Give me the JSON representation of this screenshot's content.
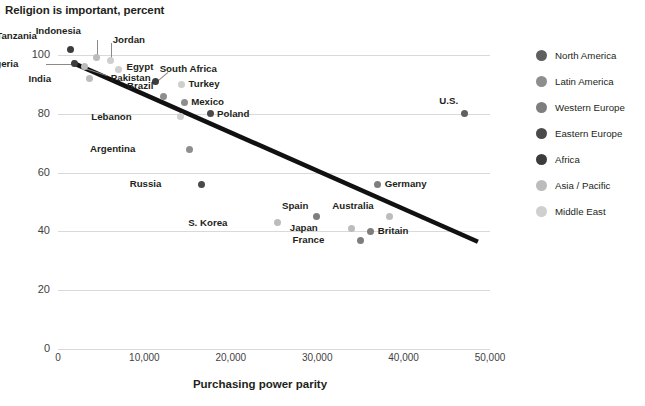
{
  "chart_data": {
    "type": "scatter",
    "title": "Religion is important, percent",
    "xlabel": "Purchasing power parity",
    "ylabel": "",
    "xlim": [
      0,
      50000
    ],
    "ylim": [
      0,
      105
    ],
    "xticks": [
      "0",
      "10,000",
      "20,000",
      "30,000",
      "40,000",
      "50,000"
    ],
    "xtick_values": [
      0,
      10000,
      20000,
      30000,
      40000,
      50000
    ],
    "yticks": [
      "0",
      "20",
      "40",
      "60",
      "80",
      "100"
    ],
    "ytick_values": [
      0,
      20,
      40,
      60,
      80,
      100
    ],
    "grid": true,
    "legend_position": "right",
    "trendline": {
      "x0": 1600,
      "y0": 97.5,
      "x1": 48600,
      "y1": 36.5,
      "color": "#111111"
    },
    "points": [
      {
        "label": "Tanzania",
        "x": 1500,
        "y": 102,
        "group": "Africa",
        "label_dx": -38,
        "label_dy": -14,
        "leader": null
      },
      {
        "label": "Nigeria",
        "x": 1900,
        "y": 97,
        "group": "Africa",
        "label_dx": -60,
        "label_dy": -1,
        "leader": "left"
      },
      {
        "label": "Indonesia",
        "x": 4500,
        "y": 99,
        "group": "Asia / Pacific",
        "label_dx": -20,
        "label_dy": -28,
        "leader": "up"
      },
      {
        "label": "Jordan",
        "x": 6100,
        "y": 98,
        "group": "Middle East",
        "label_dx": 2,
        "label_dy": -22,
        "leader": "up"
      },
      {
        "label": "Egypt",
        "x": 7000,
        "y": 95,
        "group": "Middle East",
        "label_dx": 8,
        "label_dy": -4,
        "leader": null
      },
      {
        "label": "Pakistan",
        "x": 3100,
        "y": 96,
        "group": "Asia / Pacific",
        "label_dx": 26,
        "label_dy": 10,
        "leader": "diag"
      },
      {
        "label": "India",
        "x": 3600,
        "y": 92,
        "group": "Asia / Pacific",
        "label_dx": -42,
        "label_dy": -1,
        "leader": null
      },
      {
        "label": "South Africa",
        "x": 11300,
        "y": 91,
        "group": "Africa",
        "label_dx": 4,
        "label_dy": -13,
        "leader": "diag2"
      },
      {
        "label": "Turkey",
        "x": 14300,
        "y": 90,
        "group": "Middle East",
        "label_dx": 7,
        "label_dy": -1,
        "leader": null
      },
      {
        "label": "Brazil",
        "x": 12200,
        "y": 86,
        "group": "Latin America",
        "label_dx": -14,
        "label_dy": -11,
        "leader": null
      },
      {
        "label": "Mexico",
        "x": 14600,
        "y": 84,
        "group": "Latin America",
        "label_dx": 7,
        "label_dy": -1,
        "leader": null
      },
      {
        "label": "Lebanon",
        "x": 14200,
        "y": 79,
        "group": "Middle East",
        "label_dx": -53,
        "label_dy": -1,
        "leader": null
      },
      {
        "label": "Poland",
        "x": 17600,
        "y": 80,
        "group": "Eastern Europe",
        "label_dx": 7,
        "label_dy": -1,
        "leader": null
      },
      {
        "label": "Argentina",
        "x": 15200,
        "y": 68,
        "group": "Latin America",
        "label_dx": -58,
        "label_dy": -1,
        "leader": null
      },
      {
        "label": "Russia",
        "x": 16600,
        "y": 56,
        "group": "Eastern Europe",
        "label_dx": -44,
        "label_dy": -1,
        "leader": null
      },
      {
        "label": "S. Korea",
        "x": 25400,
        "y": 43,
        "group": "Asia / Pacific",
        "label_dx": -54,
        "label_dy": -1,
        "leader": null
      },
      {
        "label": "Spain",
        "x": 29900,
        "y": 45,
        "group": "Western Europe",
        "label_dx": -12,
        "label_dy": -12,
        "leader": null
      },
      {
        "label": "Germany",
        "x": 37000,
        "y": 56,
        "group": "Western Europe",
        "label_dx": 7,
        "label_dy": -1,
        "leader": null
      },
      {
        "label": "Australia",
        "x": 38400,
        "y": 45,
        "group": "Asia / Pacific",
        "label_dx": -20,
        "label_dy": -12,
        "leader": null
      },
      {
        "label": "Japan",
        "x": 34000,
        "y": 41,
        "group": "Asia / Pacific",
        "label_dx": -38,
        "label_dy": -1,
        "leader": null
      },
      {
        "label": "Britain",
        "x": 36200,
        "y": 40,
        "group": "Western Europe",
        "label_dx": 7,
        "label_dy": -1,
        "leader": null
      },
      {
        "label": "France",
        "x": 35000,
        "y": 37,
        "group": "Western Europe",
        "label_dx": -40,
        "label_dy": -1,
        "leader": null
      },
      {
        "label": "U.S.",
        "x": 47000,
        "y": 80,
        "group": "North America",
        "label_dx": -10,
        "label_dy": -14,
        "leader": null
      }
    ]
  },
  "legend": {
    "items": [
      {
        "label": "North America",
        "color": "#5f5f5f"
      },
      {
        "label": "Latin America",
        "color": "#8e8e8e"
      },
      {
        "label": "Western Europe",
        "color": "#7e7e7e"
      },
      {
        "label": "Eastern Europe",
        "color": "#4a4a4a"
      },
      {
        "label": "Africa",
        "color": "#3c3c3c"
      },
      {
        "label": "Asia / Pacific",
        "color": "#bcbcbc"
      },
      {
        "label": "Middle East",
        "color": "#cfcfcf"
      }
    ]
  }
}
